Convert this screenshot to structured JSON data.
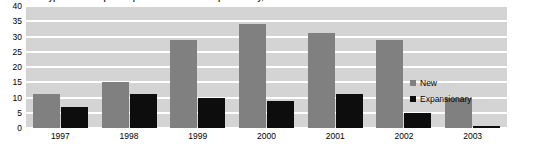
{
  "chart_data": {
    "type": "bar",
    "title": "Type of U.S. Capital Expenditure: New vs. Expansionary, 1997-2003",
    "xlabel": "",
    "ylabel": "",
    "categories": [
      "1997",
      "1998",
      "1999",
      "2000",
      "2001",
      "2002",
      "2003"
    ],
    "series": [
      {
        "name": "New",
        "color": "#808080",
        "values": [
          11,
          15,
          29,
          34,
          31,
          29,
          10
        ]
      },
      {
        "name": "Expansionary",
        "color": "#0d0d0d",
        "values": [
          7,
          11,
          10,
          9,
          11,
          5,
          0.5
        ]
      }
    ],
    "ylim": [
      0,
      40
    ],
    "yticks": [
      0,
      5,
      10,
      15,
      20,
      25,
      30,
      35,
      40
    ],
    "ytick_labels": [
      "0",
      "5",
      "10",
      "15",
      "20",
      "25",
      "30",
      "35",
      "40"
    ],
    "grid": true,
    "grid_axis": "y",
    "legend_position": "right",
    "plot_background": "#d4d4d4",
    "gridline_color": "#ffffff"
  }
}
